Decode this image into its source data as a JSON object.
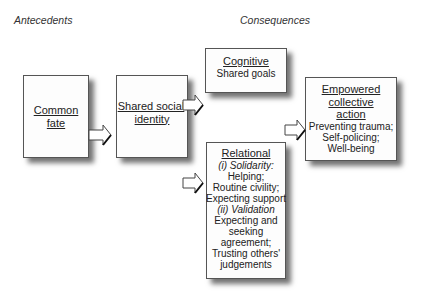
{
  "headings": {
    "antecedents": "Antecedents",
    "consequences": "Consequences"
  },
  "boxes": {
    "common_fate": {
      "title_line1": "Common",
      "title_line2": "fate"
    },
    "shared_identity": {
      "title_line1": "Shared social",
      "title_line2": "identity"
    },
    "cognitive": {
      "title": "Cognitive",
      "body": "Shared goals"
    },
    "relational": {
      "title": "Relational",
      "solidarity_label": "(i) Solidarity:",
      "solidarity_items": [
        "Helping;",
        "Routine civility;",
        "Expecting support"
      ],
      "validation_label": "(ii) Validation",
      "validation_items": [
        "Expecting and",
        "seeking",
        "agreement;",
        "Trusting others'",
        "judgements"
      ]
    },
    "empowered": {
      "title_line1": "Empowered",
      "title_line2": "collective",
      "title_line3": "action",
      "body": [
        "Preventing trauma;",
        "Self-policing;",
        "Well-being"
      ]
    }
  },
  "arrows": [
    {
      "from": "Common fate",
      "to": "Shared social identity"
    },
    {
      "from": "Shared social identity",
      "to": "Cognitive"
    },
    {
      "from": "Shared social identity",
      "to": "Relational"
    },
    {
      "from": "Consequences",
      "to": "Empowered collective action"
    }
  ]
}
